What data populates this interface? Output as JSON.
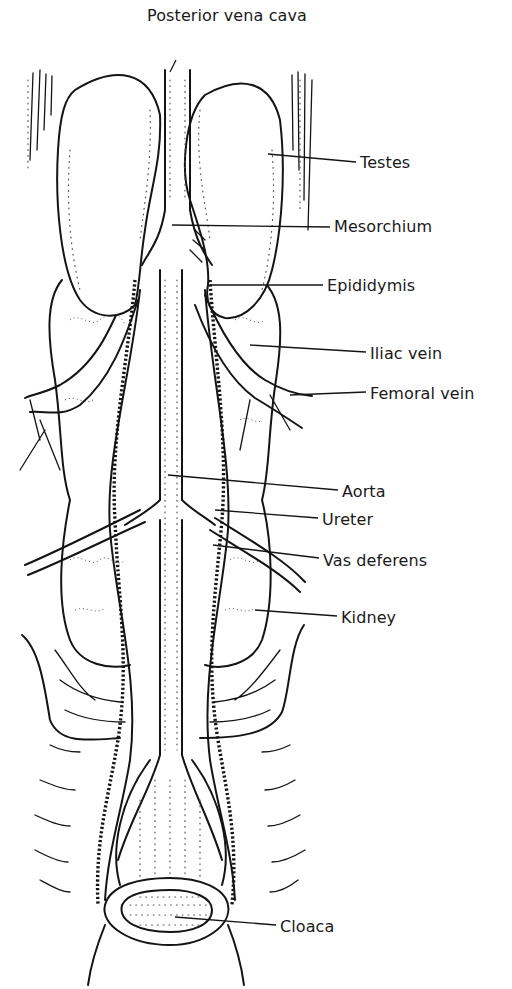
{
  "diagram": {
    "title": "",
    "labels": [
      {
        "id": "posterior-vena-cava",
        "text": "Posterior vena cava",
        "x": 147,
        "y": 8
      },
      {
        "id": "testes",
        "text": "Testes",
        "x": 360,
        "y": 155
      },
      {
        "id": "mesorchium",
        "text": "Mesorchium",
        "x": 334,
        "y": 219
      },
      {
        "id": "epididymis",
        "text": "Epididymis",
        "x": 327,
        "y": 278
      },
      {
        "id": "iliac-vein",
        "text": "Iliac vein",
        "x": 370,
        "y": 346
      },
      {
        "id": "femoral-vein",
        "text": "Femoral vein",
        "x": 370,
        "y": 386
      },
      {
        "id": "aorta",
        "text": "Aorta",
        "x": 342,
        "y": 484
      },
      {
        "id": "ureter",
        "text": "Ureter",
        "x": 322,
        "y": 512
      },
      {
        "id": "vas-deferens",
        "text": "Vas deferens",
        "x": 323,
        "y": 553
      },
      {
        "id": "kidney",
        "text": "Kidney",
        "x": 341,
        "y": 610
      },
      {
        "id": "cloaca",
        "text": "Cloaca",
        "x": 280,
        "y": 919
      }
    ]
  }
}
